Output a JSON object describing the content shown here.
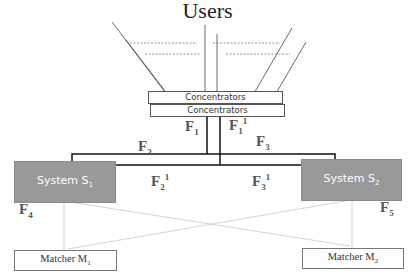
{
  "diagram": {
    "title": "Users",
    "concentrators": [
      {
        "label": "Concentrators"
      },
      {
        "label": "Concentrators"
      }
    ],
    "systems": [
      {
        "name": "System S",
        "sub": "1"
      },
      {
        "name": "System S",
        "sub": "2"
      }
    ],
    "matchers": [
      {
        "name": "Matcher M",
        "sub": "1"
      },
      {
        "name": "Matcher M",
        "sub": "2"
      }
    ],
    "flows": [
      {
        "base": "F",
        "sub": "1",
        "sup": ""
      },
      {
        "base": "F",
        "sub": "1",
        "sup": "1"
      },
      {
        "base": "F",
        "sub": "2",
        "sup": ""
      },
      {
        "base": "F",
        "sub": "3",
        "sup": ""
      },
      {
        "base": "F",
        "sub": "2",
        "sup": "1"
      },
      {
        "base": "F",
        "sub": "3",
        "sup": "1"
      },
      {
        "base": "F",
        "sub": "4",
        "sup": ""
      },
      {
        "base": "F",
        "sub": "5",
        "sup": ""
      }
    ],
    "colors": {
      "system_fill": "#999999",
      "line_dark": "#111111",
      "line_light": "#c8c8c8"
    }
  }
}
